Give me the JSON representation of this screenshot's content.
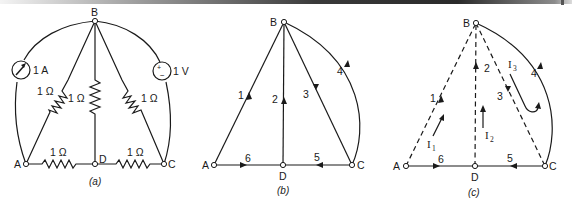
{
  "figure": {
    "panels": [
      {
        "id": "a",
        "caption": "(a)",
        "nodes": {
          "A": "A",
          "B": "B",
          "C": "C",
          "D": "D"
        },
        "elements": {
          "ammeter_label": "1 A",
          "voltmeter_label": "1 V",
          "voltmeter_plus": "+",
          "voltmeter_minus": "−",
          "r_AB": "1 Ω",
          "r_BD": "1 Ω",
          "r_BC": "1 Ω",
          "r_AD": "1 Ω",
          "r_DC": "1 Ω"
        }
      },
      {
        "id": "b",
        "caption": "(b)",
        "nodes": {
          "A": "A",
          "B": "B",
          "C": "C",
          "D": "D"
        },
        "branches": [
          {
            "label": "1",
            "from": "A",
            "to": "B"
          },
          {
            "label": "2",
            "from": "D",
            "to": "B"
          },
          {
            "label": "3",
            "from": "B",
            "to": "C"
          },
          {
            "label": "4",
            "from": "C",
            "to": "B"
          },
          {
            "label": "5",
            "from": "C",
            "to": "D"
          },
          {
            "label": "6",
            "from": "A",
            "to": "D"
          }
        ]
      },
      {
        "id": "c",
        "caption": "(c)",
        "nodes": {
          "A": "A",
          "B": "B",
          "C": "C",
          "D": "D"
        },
        "branches": [
          {
            "label": "1",
            "from": "A",
            "to": "B",
            "style": "dashed"
          },
          {
            "label": "2",
            "from": "D",
            "to": "B",
            "style": "dashed"
          },
          {
            "label": "3",
            "from": "B",
            "to": "C",
            "style": "dashed"
          },
          {
            "label": "4",
            "from": "C",
            "to": "B",
            "style": "solid"
          },
          {
            "label": "5",
            "from": "C",
            "to": "D",
            "style": "solid"
          },
          {
            "label": "6",
            "from": "A",
            "to": "D",
            "style": "solid"
          }
        ],
        "loop_currents": {
          "I1": "I",
          "I1_sub": "1",
          "I2": "I",
          "I2_sub": "2",
          "I3": "I",
          "I3_sub": "3"
        }
      }
    ]
  }
}
